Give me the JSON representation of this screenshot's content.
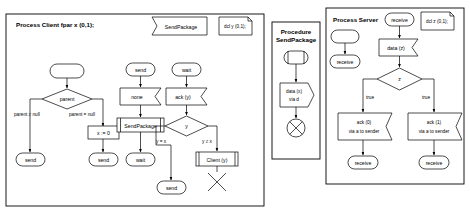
{
  "diagram": {
    "type": "sdl-process-diagram",
    "panels": [
      {
        "id": "client",
        "title": "Process Client fpar x (0,1);",
        "call_box": "SendPackage",
        "note": "dcl y (0,1);",
        "nodes": {
          "start": "",
          "decision_parent": "parent",
          "branch_left": "parent ≠ null",
          "branch_right": "parent = null",
          "task_x0": "x := 0",
          "state_send_1": "send",
          "state_send_2": "send",
          "state_send_top": "send",
          "input_none": "none",
          "call_sendpackage": "SendPackage",
          "state_wait_mid": "wait",
          "state_wait_top": "wait",
          "input_ack": "ack (y)",
          "decision_y": "y",
          "branch_yeqx": "y = x",
          "branch_yneqx": "y ≠ x",
          "state_send_bottom": "send",
          "task_client": "Client (y)",
          "stop": "stop-cross"
        }
      },
      {
        "id": "procedure",
        "title_line1": "Procedure",
        "title_line2": "SendPackage",
        "nodes": {
          "start": "procedure-start",
          "output_data": "data (x)\nvia d",
          "output_data_line1": "data (x)",
          "output_data_line2": "via d",
          "return": "return-cross"
        }
      },
      {
        "id": "server",
        "title": "Process Server",
        "state_top": "receive",
        "note": "dcl z (0,1);",
        "nodes": {
          "start": "",
          "state_receive_left": "receive",
          "input_data": "data (z)",
          "decision_z": "z",
          "branch_left": "true",
          "branch_right": "true",
          "output_ack0_line1": "ack (0)",
          "output_ack0_line2": "via a to sender",
          "output_ack1_line1": "ack (1)",
          "output_ack1_line2": "via a to sender",
          "state_receive_1": "receive",
          "state_receive_2": "receive"
        }
      }
    ]
  },
  "colors": {
    "stroke": "#000000",
    "fill": "#ffffff",
    "background": "#ffffff"
  }
}
